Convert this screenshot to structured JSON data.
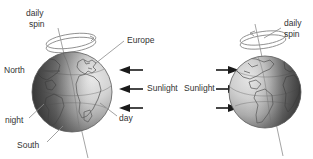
{
  "figure": {
    "background_color": "#ffffff",
    "width": 313,
    "height": 159
  },
  "left_globe": {
    "name": "earth-showing-europe-africa",
    "center": {
      "x": 72,
      "y": 92
    },
    "radius": 40,
    "labels": {
      "daily_spin": "daily\nspin",
      "daily_spin_line1": "daily",
      "daily_spin_line2": "spin",
      "europe": "Europe",
      "north": "North",
      "night": "night",
      "day": "day",
      "south": "South"
    }
  },
  "right_globe": {
    "name": "earth-showing-americas",
    "center": {
      "x": 265,
      "y": 92
    },
    "radius": 36,
    "labels": {
      "daily_spin_line1": "daily",
      "daily_spin_line2": "spin"
    }
  },
  "sunlight_left": {
    "label": "Sunlight",
    "direction": "left",
    "ray_count": 3
  },
  "sunlight_right": {
    "label": "Sunlight",
    "direction": "right",
    "ray_count": 3
  },
  "colors": {
    "text": "#333333",
    "leader_line": "#8a8a8a",
    "arrow": "#1a1a1a",
    "globe_outline": "#5a5a5a",
    "day_side": "#d8d8d8",
    "night_side": "#4a4a4a",
    "land": "#8f8f8f",
    "background": "#ffffff"
  }
}
